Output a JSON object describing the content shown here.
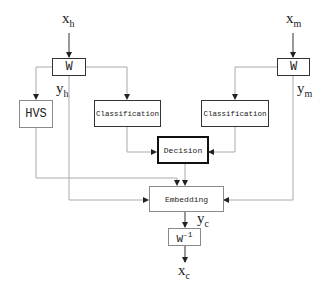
{
  "diagram": {
    "inputs": {
      "host": {
        "base": "x",
        "sub": "h"
      },
      "mark": {
        "base": "x",
        "sub": "m"
      }
    },
    "outputs": {
      "host_coeff": {
        "base": "y",
        "sub": "h"
      },
      "mark_coeff": {
        "base": "y",
        "sub": "m"
      },
      "combined_coeff": {
        "base": "y",
        "sub": "c"
      },
      "result": {
        "base": "x",
        "sub": "c"
      }
    },
    "blocks": {
      "w_left": "W",
      "w_right": "W",
      "hvs": "HVS",
      "classification_left": "Classification",
      "classification_right": "Classification",
      "decision": "Decision",
      "embedding": "Embedding",
      "w_inverse": {
        "base": "W",
        "sup": "-1"
      }
    },
    "colors": {
      "line": "#9a9a9a",
      "arrow": "#222222",
      "thick_border": "#111111"
    }
  }
}
